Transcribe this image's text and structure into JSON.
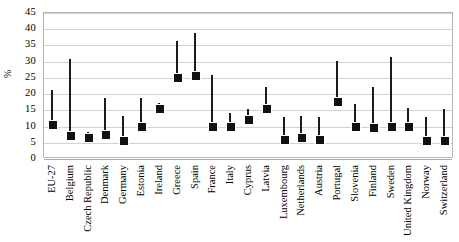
{
  "chart_data": {
    "type": "bar",
    "title": "",
    "subtitle": "",
    "xlabel": "",
    "ylabel": "%",
    "ylim": [
      0,
      45
    ],
    "ytick_step": 5,
    "yticks": [
      "0",
      "5",
      "10",
      "15",
      "20",
      "25",
      "30",
      "35",
      "40",
      "45"
    ],
    "grid": true,
    "legend": "none",
    "marker_color": "#111111",
    "bar_color": "#1c1c1c",
    "gridline_color": "#d2d2d2",
    "frame_color": "#b8b8b8",
    "categories": [
      "EU-27",
      "Belgium",
      "Czech Republic",
      "Denmark",
      "Germany",
      "Estonia",
      "Ireland",
      "Greece",
      "Spain",
      "France",
      "Italy",
      "Cyprus",
      "Latvia",
      "Luxembourg",
      "Netherlands",
      "Austria",
      "Portugal",
      "Slovenia",
      "Finland",
      "Sweden",
      "United Kingdom",
      "Norway",
      "Switzerland"
    ],
    "series": [
      {
        "name": "Value (marker)",
        "values": [
          10.5,
          7.0,
          6.5,
          7.5,
          5.5,
          10.0,
          15.5,
          25.0,
          25.5,
          10.0,
          10.0,
          12.0,
          15.5,
          6.0,
          6.5,
          6.0,
          17.5,
          10.0,
          9.5,
          10.0,
          10.0,
          5.5,
          5.5
        ]
      },
      {
        "name": "Upper value (bar top)",
        "values": [
          21.0,
          30.5,
          8.0,
          18.5,
          13.0,
          18.5,
          17.0,
          36.0,
          38.5,
          25.5,
          14.0,
          15.0,
          22.0,
          12.5,
          13.0,
          12.5,
          30.0,
          16.5,
          22.0,
          31.0,
          15.5,
          12.5,
          15.0
        ]
      }
    ]
  }
}
